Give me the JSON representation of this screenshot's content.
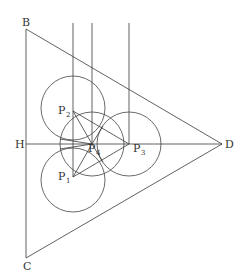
{
  "diagram": {
    "points": {
      "B": {
        "label": "B",
        "x": 26,
        "y": 29
      },
      "C": {
        "label": "C",
        "x": 26,
        "y": 258
      },
      "D": {
        "label": "D",
        "x": 222,
        "y": 144
      },
      "H": {
        "label": "H",
        "x": 26,
        "y": 144
      },
      "P1": {
        "label": "P",
        "sub": "1",
        "x": 73,
        "y": 177
      },
      "P2": {
        "label": "P",
        "sub": "2",
        "x": 73,
        "y": 111
      },
      "P3": {
        "label": "P",
        "sub": "3",
        "x": 129,
        "y": 144
      },
      "P4": {
        "label": "P",
        "sub": "4",
        "x": 92,
        "y": 144
      }
    },
    "circle_radius": 32,
    "vertical_lines_x": [
      73,
      92,
      129
    ],
    "vertical_lines_top_y": 23
  }
}
